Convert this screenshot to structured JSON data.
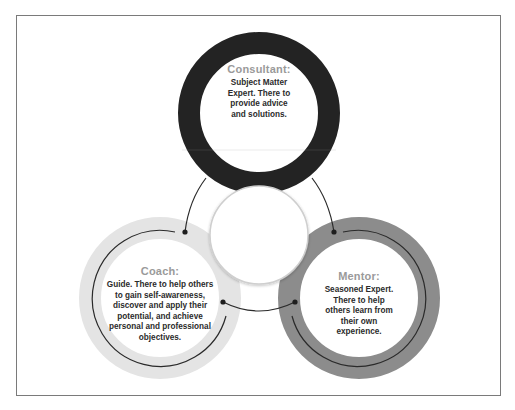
{
  "diagram": {
    "colors": {
      "consultant_ring": "#232323",
      "coach_ring": "#e4e4e4",
      "mentor_ring": "#8c8c8c",
      "connector": "#2a2a2a",
      "center_border": "#cfcfcf",
      "title_text": "#9a9a9a",
      "body_text": "#2b2b2b",
      "frame_border": "#7a7a7a"
    },
    "center_circle": {
      "label": ""
    },
    "roles": [
      {
        "id": "consultant",
        "title": "Consultant:",
        "description": "Subject Matter Expert. There to provide advice and solutions.",
        "lines": [
          "Subject Matter",
          "Expert. There to",
          "provide advice",
          "and solutions."
        ]
      },
      {
        "id": "coach",
        "title": "Coach:",
        "description": "Guide. There to help others to gain self-awareness, discover and apply their potential, and achieve personal and professional objectives.",
        "lines": [
          "Guide. There to help others",
          "to gain self-awareness,",
          "discover and apply their",
          "potential, and achieve",
          "personal and professional",
          "objectives."
        ]
      },
      {
        "id": "mentor",
        "title": "Mentor:",
        "description": "Seasoned Expert. There to help others learn from their own experience.",
        "lines": [
          "Seasoned Expert.",
          "There to help",
          "others learn from",
          "their own",
          "experience."
        ]
      }
    ]
  }
}
